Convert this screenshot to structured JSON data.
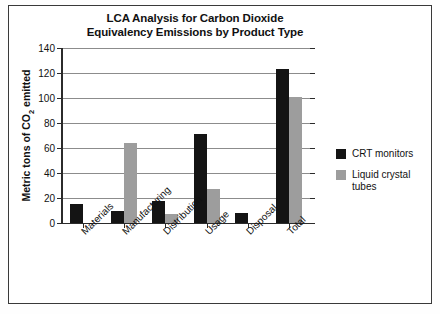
{
  "chart_data": {
    "type": "bar",
    "title": "LCA Analysis for Carbon Dioxide Equivalency Emissions by Product Type",
    "title_lines": [
      "LCA Analysis for Carbon Dioxide",
      "Equivalency Emissions by Product Type"
    ],
    "xlabel": "",
    "ylabel": "Metric tons of CO2 emitted",
    "ylabel_prefix": "Metric tons of CO",
    "ylabel_sub": "2",
    "ylabel_suffix": " emitted",
    "categories": [
      "Materials",
      "Manufacturing",
      "Distribution",
      "Usage",
      "Disposal",
      "Total"
    ],
    "series": [
      {
        "name": "CRT monitors",
        "color": "#141414",
        "values": [
          15,
          10,
          18,
          71,
          8,
          123
        ]
      },
      {
        "name": "Liquid crystal tubes",
        "color": "#9d9d9d",
        "values": [
          0,
          64,
          7,
          27,
          0,
          101
        ]
      }
    ],
    "ylim": [
      0,
      140
    ],
    "yticks": [
      0,
      20,
      40,
      60,
      80,
      100,
      120,
      140
    ],
    "ytick_labels": [
      "0",
      "20",
      "40",
      "60",
      "80",
      "100",
      "120",
      "140"
    ],
    "grid": true,
    "legend_position": "right",
    "legend": [
      {
        "label": "CRT monitors",
        "color": "#141414"
      },
      {
        "label": "Liquid crystal tubes",
        "color": "#9d9d9d"
      }
    ]
  },
  "legend_entries": [
    {
      "line1": "CRT monitors",
      "line2": ""
    },
    {
      "line1": "Liquid crystal",
      "line2": "tubes"
    }
  ]
}
